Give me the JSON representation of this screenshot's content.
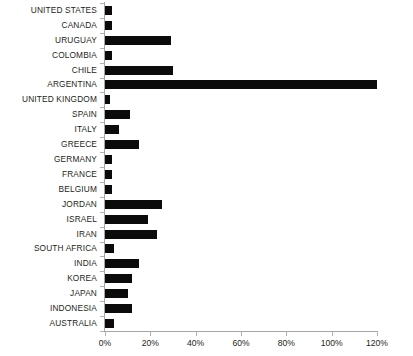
{
  "chart_data": {
    "type": "bar",
    "orientation": "horizontal",
    "title": "",
    "subtitle": "",
    "xlabel": "",
    "ylabel": "",
    "xlim": [
      0,
      125
    ],
    "grid": false,
    "legend": null,
    "bar_color": "#0b0b0b",
    "axis_color": "#a6a6a6",
    "background": "#ffffff",
    "tick_suffix": "%",
    "xticks": [
      0,
      20,
      40,
      60,
      80,
      100,
      120
    ],
    "xtick_labels": [
      "0%",
      "20%",
      "40%",
      "60%",
      "80%",
      "100%",
      "120%"
    ],
    "categories": [
      "UNITED STATES",
      "CANADA",
      "URUGUAY",
      "COLOMBIA",
      "CHILE",
      "ARGENTINA",
      "UNITED KINGDOM",
      "SPAIN",
      "ITALY",
      "GREECE",
      "GERMANY",
      "FRANCE",
      "BELGIUM",
      "JORDAN",
      "ISRAEL",
      "IRAN",
      "SOUTH AFRICA",
      "INDIA",
      "KOREA",
      "JAPAN",
      "INDONESIA",
      "AUSTRALIA"
    ],
    "values": [
      3,
      3,
      29,
      3,
      30,
      122,
      2,
      11,
      6,
      15,
      3,
      3,
      3,
      25,
      19,
      23,
      4,
      15,
      12,
      10,
      12,
      4
    ]
  }
}
